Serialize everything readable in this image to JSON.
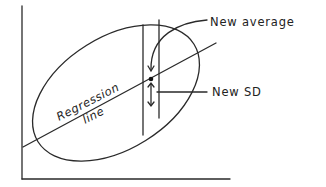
{
  "diagram": {
    "type": "scatter-ellipse-regression",
    "labels": {
      "new_average": "New average",
      "new_sd": "New SD",
      "regression_line_1": "Regression",
      "regression_line_2": "line"
    },
    "axes": {
      "x_axis": true,
      "y_axis": true,
      "tick_labels": []
    },
    "elements": [
      "point cloud ellipse",
      "regression line",
      "vertical strip",
      "average point",
      "SD double arrow"
    ],
    "colors": {
      "ink": "#2a2a2a",
      "background": "#ffffff"
    }
  }
}
